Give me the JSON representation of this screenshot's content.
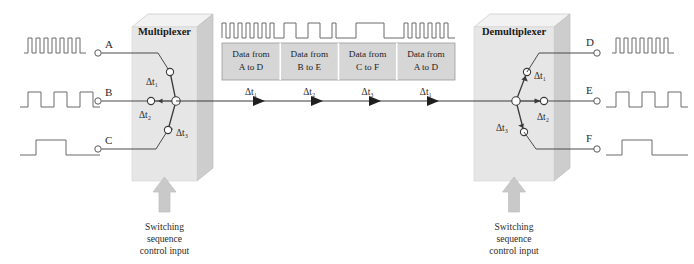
{
  "figure": {
    "colors": {
      "block_front": "#e3e3e3",
      "block_top": "#f0f0f0",
      "block_side": "#cfcfcf",
      "frame_fill": "#d4d4d4",
      "line": "#3a3a3a",
      "wave": "#6b6b6b",
      "background": "#ffffff"
    }
  },
  "multiplexer": {
    "label": "Multiplexer",
    "control_caption": [
      "Switching",
      "sequence",
      "control input"
    ],
    "switch_positions": [
      {
        "id": "dt1",
        "label": "Δt₁"
      },
      {
        "id": "dt2",
        "label": "Δt₂"
      },
      {
        "id": "dt3",
        "label": "Δt₃"
      }
    ]
  },
  "demultiplexer": {
    "label": "Demultiplexer",
    "control_caption": [
      "Switching",
      "sequence",
      "control input"
    ],
    "switch_positions": [
      {
        "id": "dt1",
        "label": "Δt₁"
      },
      {
        "id": "dt2",
        "label": "Δt₂"
      },
      {
        "id": "dt3",
        "label": "Δt₃"
      }
    ]
  },
  "inputs": [
    {
      "id": "A",
      "label": "A",
      "pulses": 7,
      "rate": "fast"
    },
    {
      "id": "B",
      "label": "B",
      "pulses": 4,
      "rate": "medium"
    },
    {
      "id": "C",
      "label": "C",
      "pulses": 1,
      "rate": "slow"
    }
  ],
  "outputs": [
    {
      "id": "D",
      "label": "D",
      "pulses": 7,
      "rate": "fast"
    },
    {
      "id": "E",
      "label": "E",
      "pulses": 4,
      "rate": "medium"
    },
    {
      "id": "F",
      "label": "F",
      "pulses": 1,
      "rate": "slow"
    }
  ],
  "frames": [
    {
      "line1": "Data from",
      "line2": "A to D",
      "interval": "Δt₁"
    },
    {
      "line1": "Data from",
      "line2": "B to E",
      "interval": "Δt₂"
    },
    {
      "line1": "Data from",
      "line2": "C to F",
      "interval": "Δt₃"
    },
    {
      "line1": "Data from",
      "line2": "A to D",
      "interval": "Δt₁"
    }
  ]
}
